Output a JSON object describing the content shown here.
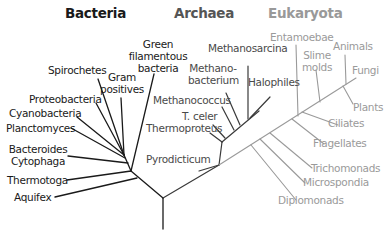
{
  "colors": {
    "bacteria": "#1a1a1a",
    "archaea": "#4a4a4a",
    "eukaryota": "#9a9a9a"
  },
  "domains": {
    "bacteria": "Bacteria",
    "archaea": "Archaea",
    "eukaryota": "Eukaryota"
  },
  "bacteria": {
    "green_filamentous_1": "Green",
    "green_filamentous_2": "filamentous",
    "green_filamentous_3": "bacteria",
    "spirochetes": "Spirochetes",
    "gram_positives_1": "Gram",
    "gram_positives_2": "positives",
    "proteobacteria": "Proteobacteria",
    "cyanobacteria": "Cyanobacteria",
    "planctomyces": "Planctomyces",
    "bacteroides_1": "Bacteroides",
    "bacteroides_2": "Cytophaga",
    "thermotoga": "Thermotoga",
    "aquifex": "Aquifex"
  },
  "archaea": {
    "methanosarcina": "Methanosarcina",
    "methanobacterium_1": "Methano-",
    "methanobacterium_2": "bacterium",
    "halophiles": "Halophiles",
    "methanococcus": "Methanococcus",
    "t_celer": "T. celer",
    "thermoproteus": "Thermoproteus",
    "pyrodicticum": "Pyrodicticum"
  },
  "eukaryota": {
    "entamoebae": "Entamoebae",
    "slime_molds_1": "Slime",
    "slime_molds_2": "molds",
    "animals": "Animals",
    "fungi": "Fungi",
    "plants": "Plants",
    "ciliates": "Ciliates",
    "flagellates": "Flagellates",
    "trichomonads": "Trichomonads",
    "microspondia": "Microspondia",
    "diplomonads": "Diplomonads"
  }
}
